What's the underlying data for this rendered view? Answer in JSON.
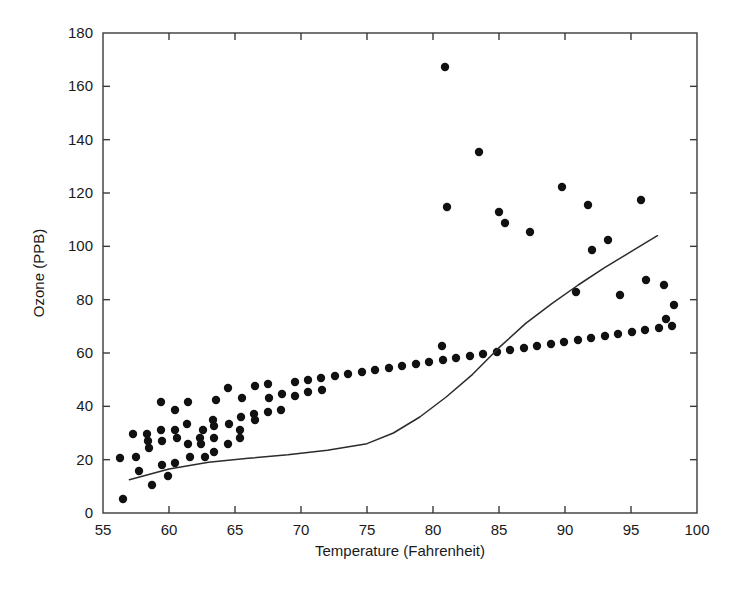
{
  "chart_data": {
    "type": "scatter",
    "title": "",
    "subtitle": "",
    "xlabel": "Temperature (Fahrenheit)",
    "ylabel": "Ozone (PPB)",
    "xlim": [
      55,
      100
    ],
    "ylim": [
      0,
      180
    ],
    "xticks": [
      55,
      60,
      65,
      70,
      75,
      80,
      85,
      90,
      95,
      100
    ],
    "yticks": [
      0,
      20,
      40,
      60,
      80,
      100,
      120,
      140,
      160,
      180
    ],
    "xtick_labels": [
      "55",
      "60",
      "65",
      "70",
      "75",
      "80",
      "85",
      "90",
      "95",
      "100"
    ],
    "ytick_labels": [
      "0",
      "20",
      "40",
      "60",
      "80",
      "100",
      "120",
      "140",
      "160",
      "180"
    ],
    "grid": false,
    "legend": null,
    "marker": {
      "shape": "circle",
      "size_px": 4.2,
      "color": "#111111"
    },
    "series": [
      {
        "name": "Ozone observations",
        "type": "scatter",
        "color": "#111111",
        "points": [
          [
            67,
            41
          ],
          [
            72,
            36
          ],
          [
            74,
            12
          ],
          [
            62,
            18
          ],
          [
            66,
            28
          ],
          [
            65,
            23
          ],
          [
            59,
            19
          ],
          [
            61,
            8
          ],
          [
            69,
            16
          ],
          [
            74,
            11
          ],
          [
            69,
            14
          ],
          [
            66,
            18
          ],
          [
            68,
            14
          ],
          [
            58,
            34
          ],
          [
            64,
            6
          ],
          [
            66,
            30
          ],
          [
            57,
            11
          ],
          [
            68,
            1
          ],
          [
            62,
            11
          ],
          [
            59,
            4
          ],
          [
            73,
            32
          ],
          [
            61,
            23
          ],
          [
            61,
            45
          ],
          [
            57,
            115
          ],
          [
            58,
            37
          ],
          [
            57,
            29
          ],
          [
            67,
            71
          ],
          [
            81,
            39
          ],
          [
            79,
            23
          ],
          [
            76,
            21
          ],
          [
            78,
            37
          ],
          [
            74,
            20
          ],
          [
            67,
            12
          ],
          [
            84,
            13
          ],
          [
            85,
            135
          ],
          [
            79,
            49
          ],
          [
            82,
            32
          ],
          [
            87,
            64
          ],
          [
            90,
            40
          ],
          [
            87,
            77
          ],
          [
            93,
            97
          ],
          [
            92,
            97
          ],
          [
            82,
            85
          ],
          [
            80,
            10
          ],
          [
            79,
            27
          ],
          [
            77,
            7
          ],
          [
            72,
            48
          ],
          [
            65,
            35
          ],
          [
            73,
            61
          ],
          [
            76,
            79
          ],
          [
            77,
            63
          ],
          [
            76,
            16
          ],
          [
            76,
            80
          ],
          [
            76,
            108
          ],
          [
            76,
            20
          ],
          [
            75,
            52
          ],
          [
            78,
            82
          ],
          [
            73,
            50
          ],
          [
            80,
            64
          ],
          [
            77,
            59
          ],
          [
            83,
            39
          ],
          [
            84,
            9
          ],
          [
            85,
            16
          ],
          [
            81,
            78
          ],
          [
            84,
            35
          ],
          [
            83,
            66
          ],
          [
            83,
            122
          ],
          [
            88,
            89
          ],
          [
            92,
            110
          ],
          [
            92,
            44
          ],
          [
            89,
            28
          ],
          [
            82,
            65
          ],
          [
            73,
            22
          ],
          [
            81,
            59
          ],
          [
            91,
            23
          ],
          [
            80,
            31
          ],
          [
            81,
            44
          ],
          [
            82,
            21
          ],
          [
            84,
            9
          ],
          [
            87,
            45
          ],
          [
            85,
            168
          ],
          [
            74,
            73
          ],
          [
            81,
            76
          ],
          [
            82,
            118
          ],
          [
            86,
            84
          ],
          [
            85,
            85
          ],
          [
            82,
            96
          ],
          [
            86,
            78
          ],
          [
            88,
            73
          ],
          [
            86,
            91
          ],
          [
            83,
            47
          ],
          [
            81,
            32
          ],
          [
            81,
            20
          ],
          [
            82,
            23
          ],
          [
            86,
            21
          ],
          [
            85,
            24
          ],
          [
            87,
            44
          ],
          [
            89,
            21
          ],
          [
            90,
            28
          ],
          [
            90,
            9
          ],
          [
            92,
            13
          ],
          [
            86,
            46
          ],
          [
            86,
            18
          ],
          [
            82,
            13
          ],
          [
            80,
            24
          ],
          [
            79,
            16
          ],
          [
            77,
            13
          ],
          [
            79,
            23
          ],
          [
            76,
            36
          ],
          [
            78,
            7
          ],
          [
            78,
            14
          ],
          [
            77,
            30
          ],
          [
            72,
            14
          ],
          [
            75,
            18
          ],
          [
            79,
            20
          ]
        ],
        "plotted_px": [
          [
            123,
            499
          ],
          [
            152,
            485
          ],
          [
            168,
            476
          ],
          [
            139,
            471
          ],
          [
            162,
            465
          ],
          [
            175,
            463
          ],
          [
            136,
            457
          ],
          [
            190,
            457
          ],
          [
            205,
            457
          ],
          [
            214,
            452
          ],
          [
            149,
            448
          ],
          [
            188,
            444
          ],
          [
            201,
            444
          ],
          [
            228,
            444
          ],
          [
            148,
            441
          ],
          [
            162,
            441
          ],
          [
            177,
            438
          ],
          [
            200,
            438
          ],
          [
            214,
            438
          ],
          [
            240,
            438
          ],
          [
            133,
            434
          ],
          [
            147,
            434
          ],
          [
            161,
            430
          ],
          [
            175,
            430
          ],
          [
            203,
            430
          ],
          [
            240,
            430
          ],
          [
            214,
            426
          ],
          [
            187,
            424
          ],
          [
            229,
            424
          ],
          [
            120,
            458
          ],
          [
            213,
            420
          ],
          [
            175,
            410
          ],
          [
            255,
            420
          ],
          [
            241,
            417
          ],
          [
            254,
            414
          ],
          [
            268,
            412
          ],
          [
            281,
            410
          ],
          [
            161,
            402
          ],
          [
            188,
            402
          ],
          [
            216,
            400
          ],
          [
            242,
            398
          ],
          [
            269,
            398
          ],
          [
            295,
            396
          ],
          [
            282,
            394
          ],
          [
            308,
            392
          ],
          [
            322,
            390
          ],
          [
            228,
            388
          ],
          [
            255,
            386
          ],
          [
            268,
            384
          ],
          [
            295,
            382
          ],
          [
            308,
            380
          ],
          [
            321,
            378
          ],
          [
            335,
            376
          ],
          [
            348,
            374
          ],
          [
            362,
            372
          ],
          [
            375,
            370
          ],
          [
            389,
            368
          ],
          [
            402,
            366
          ],
          [
            416,
            364
          ],
          [
            429,
            362
          ],
          [
            443,
            360
          ],
          [
            456,
            358
          ],
          [
            470,
            356
          ],
          [
            483,
            354
          ],
          [
            497,
            352
          ],
          [
            510,
            350
          ],
          [
            524,
            348
          ],
          [
            537,
            346
          ],
          [
            551,
            344
          ],
          [
            564,
            342
          ],
          [
            578,
            340
          ],
          [
            591,
            338
          ],
          [
            605,
            336
          ],
          [
            618,
            334
          ],
          [
            632,
            332
          ],
          [
            645,
            330
          ],
          [
            659,
            328
          ],
          [
            672,
            326
          ],
          [
            445,
            67
          ],
          [
            479,
            152
          ],
          [
            447,
            207
          ],
          [
            505,
            223
          ],
          [
            442,
            346
          ],
          [
            499,
            212
          ],
          [
            562,
            187
          ],
          [
            641,
            200
          ],
          [
            588,
            205
          ],
          [
            530,
            232
          ],
          [
            608,
            240
          ],
          [
            592,
            250
          ],
          [
            646,
            280
          ],
          [
            576,
            292
          ],
          [
            620,
            295
          ],
          [
            664,
            285
          ],
          [
            674,
            305
          ],
          [
            666,
            319
          ]
        ]
      },
      {
        "name": "LOWESS smoothing curve",
        "type": "line",
        "color": "#2b2b2b",
        "points": [
          [
            57,
            12.5
          ],
          [
            60,
            16.5
          ],
          [
            63,
            19.0
          ],
          [
            66,
            20.5
          ],
          [
            69,
            21.8
          ],
          [
            72,
            23.5
          ],
          [
            75,
            26.0
          ],
          [
            77,
            30.0
          ],
          [
            79,
            36.0
          ],
          [
            81,
            43.5
          ],
          [
            83,
            52.0
          ],
          [
            85,
            62.0
          ],
          [
            87,
            71.0
          ],
          [
            89,
            78.5
          ],
          [
            91,
            85.5
          ],
          [
            93,
            92.0
          ],
          [
            95,
            98.0
          ],
          [
            97,
            104.0
          ]
        ]
      }
    ],
    "annotations": []
  },
  "figure": {
    "background_color": "#ffffff",
    "axis_color": "#3a3a3a",
    "text_color": "#1a1a1a"
  }
}
